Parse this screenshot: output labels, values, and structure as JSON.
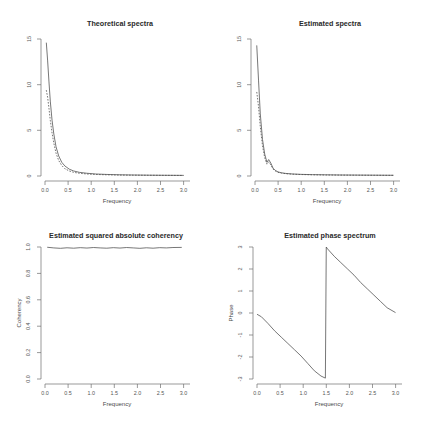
{
  "figure": {
    "layout": "2x2-grid",
    "background": "#ffffff",
    "ink_color": "#4a4a4a"
  },
  "panels": [
    {
      "id": "theoretical-spectra",
      "title": "Theoretical spectra",
      "xlabel": "Frequency",
      "ylabel": "",
      "xticks": [
        "0.0",
        "0.5",
        "1.0",
        "1.5",
        "2.0",
        "2.5",
        "3.0"
      ],
      "yticks": [
        "0",
        "5",
        "10",
        "15"
      ]
    },
    {
      "id": "estimated-spectra",
      "title": "Estimated spectra",
      "xlabel": "Frequency",
      "ylabel": "",
      "xticks": [
        "0.0",
        "0.5",
        "1.0",
        "1.5",
        "2.0",
        "2.5",
        "3.0"
      ],
      "yticks": [
        "0",
        "5",
        "10",
        "15"
      ]
    },
    {
      "id": "estimated-squared-absolute-coherency",
      "title": "Estimated squared absolute coherency",
      "xlabel": "Frequency",
      "ylabel": "Coherency",
      "xticks": [
        "0.0",
        "0.5",
        "1.0",
        "1.5",
        "2.0",
        "2.5",
        "3.0"
      ],
      "yticks": [
        "0.0",
        "0.2",
        "0.4",
        "0.6",
        "0.8",
        "1.0"
      ]
    },
    {
      "id": "estimated-phase-spectrum",
      "title": "Estimated phase spectrum",
      "xlabel": "Frequency",
      "ylabel": "Phase",
      "xticks": [
        "0.0",
        "0.5",
        "1.0",
        "1.5",
        "2.0",
        "2.5",
        "3.0"
      ],
      "yticks": [
        "-3",
        "-2",
        "-1",
        "0",
        "1",
        "2",
        "3"
      ]
    }
  ],
  "chart_data": [
    {
      "type": "line",
      "title": "Theoretical spectra",
      "xlabel": "Frequency",
      "ylabel": "",
      "xlim": [
        0.0,
        3.1416
      ],
      "ylim": [
        0,
        15
      ],
      "grid": false,
      "legend": "none",
      "x": [
        0.03,
        0.06,
        0.09,
        0.12,
        0.16,
        0.2,
        0.25,
        0.31,
        0.38,
        0.45,
        0.55,
        0.65,
        0.78,
        0.95,
        1.15,
        1.4,
        1.7,
        2.0,
        2.35,
        2.7,
        3.14
      ],
      "series": [
        {
          "name": "series-1",
          "style": "solid",
          "values": [
            14.6,
            12.6,
            10.3,
            8.2,
            6.1,
            4.6,
            3.2,
            2.2,
            1.5,
            1.1,
            0.75,
            0.55,
            0.4,
            0.3,
            0.22,
            0.17,
            0.13,
            0.11,
            0.09,
            0.08,
            0.07
          ]
        },
        {
          "name": "series-2",
          "style": "dashed",
          "values": [
            9.4,
            8.6,
            7.4,
            6.1,
            4.7,
            3.6,
            2.5,
            1.7,
            1.15,
            0.8,
            0.55,
            0.4,
            0.3,
            0.22,
            0.17,
            0.13,
            0.1,
            0.09,
            0.08,
            0.07,
            0.06
          ]
        }
      ]
    },
    {
      "type": "line",
      "title": "Estimated spectra",
      "xlabel": "Frequency",
      "ylabel": "",
      "xlim": [
        0.0,
        3.1416
      ],
      "ylim": [
        0,
        15
      ],
      "grid": false,
      "legend": "none",
      "x": [
        0.04,
        0.08,
        0.12,
        0.17,
        0.22,
        0.27,
        0.31,
        0.36,
        0.41,
        0.46,
        0.52,
        0.6,
        0.7,
        0.85,
        1.05,
        1.3,
        1.6,
        1.95,
        2.3,
        2.7,
        3.14
      ],
      "series": [
        {
          "name": "series-1",
          "style": "solid",
          "values": [
            14.3,
            10.5,
            6.8,
            4.0,
            2.4,
            1.5,
            1.8,
            1.4,
            0.85,
            0.62,
            0.45,
            0.35,
            0.28,
            0.22,
            0.18,
            0.15,
            0.13,
            0.11,
            0.1,
            0.09,
            0.08
          ]
        },
        {
          "name": "series-2",
          "style": "dashed",
          "values": [
            9.2,
            7.6,
            5.4,
            3.3,
            2.0,
            1.3,
            1.55,
            1.2,
            0.75,
            0.55,
            0.4,
            0.32,
            0.25,
            0.2,
            0.16,
            0.13,
            0.11,
            0.1,
            0.09,
            0.08,
            0.07
          ]
        }
      ]
    },
    {
      "type": "line",
      "title": "Estimated squared absolute coherency",
      "xlabel": "Frequency",
      "ylabel": "Coherency",
      "xlim": [
        0.0,
        3.1416
      ],
      "ylim": [
        0.0,
        1.0
      ],
      "grid": false,
      "legend": "none",
      "x": [
        0.05,
        0.2,
        0.35,
        0.5,
        0.65,
        0.8,
        0.95,
        1.1,
        1.25,
        1.4,
        1.55,
        1.7,
        1.85,
        2.0,
        2.15,
        2.3,
        2.45,
        2.6,
        2.75,
        2.9,
        3.1
      ],
      "series": [
        {
          "name": "coherency",
          "style": "solid",
          "values": [
            0.998,
            0.993,
            0.99,
            0.994,
            0.991,
            0.995,
            0.992,
            0.996,
            0.993,
            0.991,
            0.995,
            0.992,
            0.996,
            0.993,
            0.99,
            0.994,
            0.991,
            0.995,
            0.993,
            0.996,
            0.997
          ]
        }
      ]
    },
    {
      "type": "line",
      "title": "Estimated phase spectrum",
      "xlabel": "Frequency",
      "ylabel": "Phase",
      "xlim": [
        0.0,
        3.1416
      ],
      "ylim": [
        -3.1416,
        3.1416
      ],
      "grid": false,
      "legend": "none",
      "annotation": "phase wraps from -pi to +pi at frequency 1.57",
      "x": [
        0.0,
        0.1,
        0.25,
        0.4,
        0.55,
        0.7,
        0.85,
        1.0,
        1.15,
        1.3,
        1.45,
        1.55,
        1.57,
        1.6,
        1.75,
        1.9,
        2.05,
        2.2,
        2.35,
        2.5,
        2.65,
        2.8,
        2.95,
        3.14
      ],
      "series": [
        {
          "name": "phase",
          "style": "solid",
          "values": [
            -0.06,
            -0.18,
            -0.5,
            -0.85,
            -1.15,
            -1.45,
            -1.75,
            -2.05,
            -2.4,
            -2.75,
            -3.0,
            -3.1,
            3.14,
            3.05,
            2.7,
            2.4,
            2.1,
            1.8,
            1.45,
            1.15,
            0.85,
            0.55,
            0.25,
            0.02
          ]
        }
      ]
    }
  ]
}
